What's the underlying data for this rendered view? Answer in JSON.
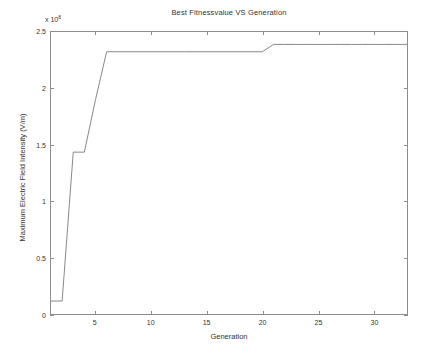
{
  "chart_data": {
    "type": "line",
    "title": "Best Fitnessvalue VS Generation",
    "xlabel": "Generation",
    "ylabel": "Maximum Electric Field Intensity (V/m)",
    "y_exponent_label": "x 10",
    "y_exponent_power": "8",
    "xlim": [
      1,
      33
    ],
    "ylim": [
      0,
      2.5
    ],
    "y_scale_factor": 100000000.0,
    "grid": false,
    "legend": null,
    "xticks": [
      5,
      10,
      15,
      20,
      25,
      30
    ],
    "xticklabels": [
      "5",
      "10",
      "15",
      "20",
      "25",
      "30"
    ],
    "yticks": [
      0,
      0.5,
      1,
      1.5,
      2,
      2.5
    ],
    "yticklabels": [
      "0",
      "0.5",
      "1",
      "1.5",
      "2",
      "2.5"
    ],
    "line_color": "#7a7a7a",
    "series": [
      {
        "name": "Best fitness value",
        "x": [
          1,
          2,
          3,
          4,
          5,
          6,
          7,
          8,
          9,
          10,
          11,
          12,
          13,
          14,
          15,
          16,
          17,
          18,
          19,
          20,
          21,
          22,
          23,
          24,
          25,
          26,
          27,
          28,
          29,
          30,
          31,
          32,
          33
        ],
        "values": [
          0.115,
          0.115,
          1.435,
          1.435,
          1.9,
          2.325,
          2.325,
          2.325,
          2.325,
          2.325,
          2.325,
          2.325,
          2.325,
          2.325,
          2.325,
          2.325,
          2.325,
          2.325,
          2.325,
          2.325,
          2.39,
          2.39,
          2.39,
          2.39,
          2.39,
          2.39,
          2.39,
          2.39,
          2.39,
          2.39,
          2.39,
          2.39,
          2.39
        ]
      }
    ]
  }
}
